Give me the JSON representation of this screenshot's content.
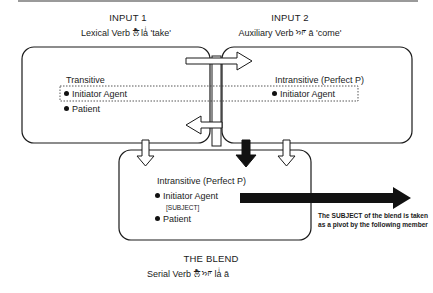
{
  "input1": {
    "title": "INPUT 1",
    "subtitle": "Lexical Verb ਲੈ laͥ 'take'",
    "frame_label": "Transitive",
    "items": [
      "Initiator Agent",
      "Patient"
    ]
  },
  "input2": {
    "title": "INPUT 2",
    "subtitle": "Auxiliary Verb ਆ ā 'come'",
    "frame_label": "Intransitive (Perfect P)",
    "items": [
      "Initiator Agent"
    ]
  },
  "blend": {
    "title": "THE BLEND",
    "subtitle": "Serial Verb ਲੈ ਆ laͥ ā",
    "frame_label": "Intransitive (Perfect P)",
    "items": [
      "Initiator Agent",
      "Patient"
    ],
    "subject_tag": "[SUBJECT]"
  },
  "annotation": "The SUBJECT of the blend is taken as a pivot by the following member",
  "colors": {
    "line": "#1a1a1a",
    "topline": "#9a9a9a",
    "fill_black": "#111111"
  }
}
